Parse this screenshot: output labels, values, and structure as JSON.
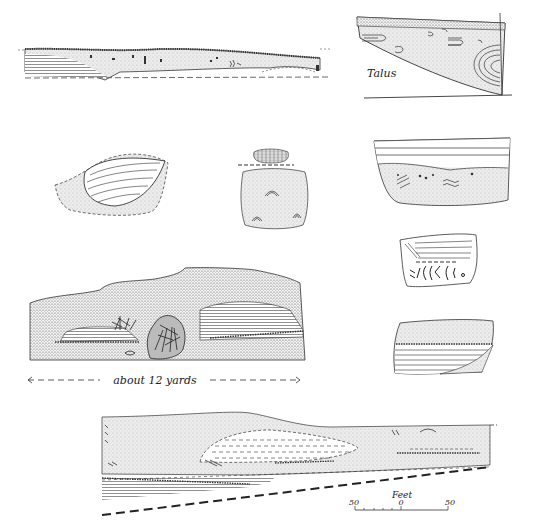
{
  "figures": {
    "section_a": {
      "label": ""
    },
    "section_talus": {
      "label": "Talus"
    },
    "lens_crossbedded": {
      "label": ""
    },
    "block_with_cap": {
      "label": ""
    },
    "section_wavy": {
      "label": ""
    },
    "block_herringbone": {
      "label": ""
    },
    "block_laminated": {
      "label": ""
    },
    "outcrop_sketch": {
      "label": "about 12 yards"
    },
    "long_section": {
      "label": ""
    }
  },
  "scale_bar": {
    "title": "Feet",
    "ticks": [
      "50",
      "0",
      "50"
    ]
  },
  "colors": {
    "ink": "#222222",
    "fill": "#e6e6e6",
    "background": "#ffffff"
  }
}
